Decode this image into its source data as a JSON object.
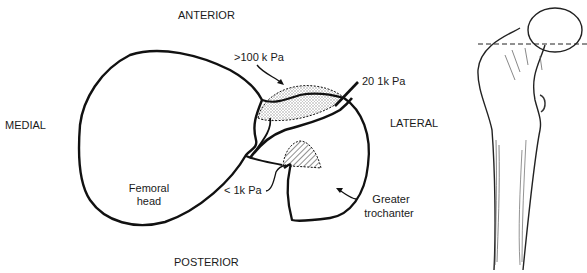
{
  "diagram": {
    "orientation": {
      "anterior": "ANTERIOR",
      "posterior": "POSTERIOR",
      "medial": "MEDIAL",
      "lateral": "LATERAL"
    },
    "annotations": {
      "high_pressure": ">100 k Pa",
      "mid_pressure": "20 1k Pa",
      "low_pressure": "< 1k Pa",
      "femoral_head_line1": "Femoral",
      "femoral_head_line2": "head",
      "trochanter_line1": "Greater",
      "trochanter_line2": "trochanter"
    },
    "colors": {
      "stroke": "#111111",
      "stipple": "#9a9a9a",
      "hatch": "#333333",
      "background": "#ffffff"
    }
  }
}
